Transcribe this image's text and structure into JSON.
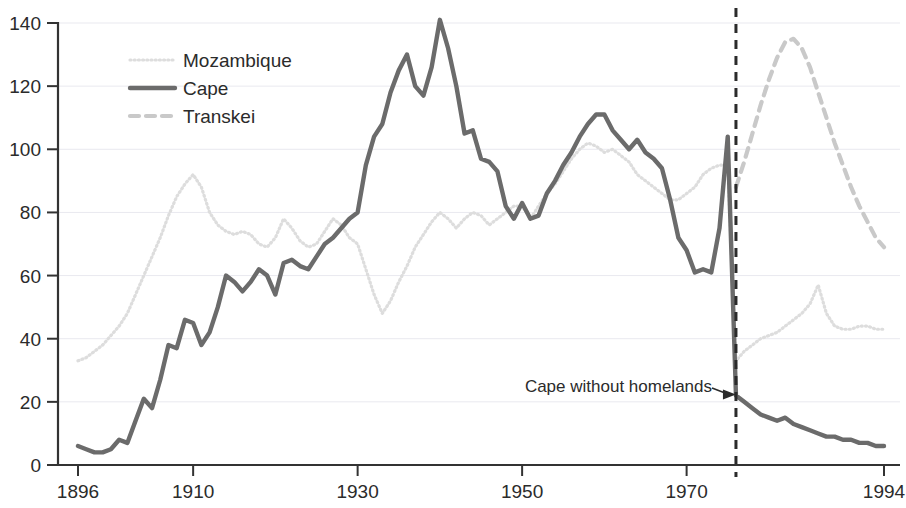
{
  "chart_data": {
    "type": "line",
    "title": "",
    "xlabel": "",
    "ylabel": "",
    "xlim": [
      1896,
      1994
    ],
    "ylim": [
      0,
      140
    ],
    "yticks": [
      0,
      20,
      40,
      60,
      80,
      100,
      120,
      140
    ],
    "xticks": [
      1896,
      1910,
      1930,
      1950,
      1970,
      1994
    ],
    "grid": true,
    "legend_position": "upper-left-inside",
    "annotations": [
      {
        "text": "Cape without homelands",
        "x": 1976,
        "y": 22,
        "arrow": true
      }
    ],
    "vertical_reference_line": {
      "x": 1976,
      "style": "dashed",
      "color": "#2b2b2b"
    },
    "series": [
      {
        "name": "Mozambique",
        "color": "#dddddd",
        "style": "dotted",
        "x": [
          1896,
          1897,
          1898,
          1899,
          1900,
          1901,
          1902,
          1903,
          1904,
          1905,
          1906,
          1907,
          1908,
          1909,
          1910,
          1911,
          1912,
          1913,
          1914,
          1915,
          1916,
          1917,
          1918,
          1919,
          1920,
          1921,
          1922,
          1923,
          1924,
          1925,
          1926,
          1927,
          1928,
          1929,
          1930,
          1931,
          1932,
          1933,
          1934,
          1935,
          1936,
          1937,
          1938,
          1939,
          1940,
          1941,
          1942,
          1943,
          1944,
          1945,
          1946,
          1947,
          1948,
          1949,
          1950,
          1951,
          1952,
          1953,
          1954,
          1955,
          1956,
          1957,
          1958,
          1959,
          1960,
          1961,
          1962,
          1963,
          1964,
          1965,
          1966,
          1967,
          1968,
          1969,
          1970,
          1971,
          1972,
          1973,
          1974,
          1975,
          1976,
          1977,
          1978,
          1979,
          1980,
          1981,
          1982,
          1983,
          1984,
          1985,
          1986,
          1987,
          1988,
          1989,
          1990,
          1991,
          1992,
          1993,
          1994
        ],
        "values": [
          33,
          34,
          36,
          38,
          41,
          44,
          48,
          54,
          60,
          66,
          72,
          79,
          85,
          89,
          92,
          88,
          80,
          76,
          74,
          73,
          74,
          73,
          70,
          69,
          72,
          78,
          75,
          71,
          69,
          70,
          74,
          78,
          76,
          72,
          70,
          62,
          54,
          48,
          52,
          58,
          63,
          69,
          73,
          77,
          80,
          78,
          75,
          78,
          80,
          79,
          76,
          78,
          80,
          82,
          82,
          78,
          82,
          86,
          89,
          93,
          97,
          100,
          102,
          101,
          99,
          100,
          98,
          96,
          92,
          90,
          88,
          86,
          84,
          84,
          86,
          88,
          92,
          94,
          95,
          95,
          33,
          36,
          38,
          40,
          41,
          42,
          44,
          46,
          48,
          51,
          57,
          48,
          44,
          43,
          43,
          44,
          44,
          43,
          43
        ]
      },
      {
        "name": "Cape",
        "color": "#6b6b6b",
        "style": "solid",
        "x": [
          1896,
          1897,
          1898,
          1899,
          1900,
          1901,
          1902,
          1903,
          1904,
          1905,
          1906,
          1907,
          1908,
          1909,
          1910,
          1911,
          1912,
          1913,
          1914,
          1915,
          1916,
          1917,
          1918,
          1919,
          1920,
          1921,
          1922,
          1923,
          1924,
          1925,
          1926,
          1927,
          1928,
          1929,
          1930,
          1931,
          1932,
          1933,
          1934,
          1935,
          1936,
          1937,
          1938,
          1939,
          1940,
          1941,
          1942,
          1943,
          1944,
          1945,
          1946,
          1947,
          1948,
          1949,
          1950,
          1951,
          1952,
          1953,
          1954,
          1955,
          1956,
          1957,
          1958,
          1959,
          1960,
          1961,
          1962,
          1963,
          1964,
          1965,
          1966,
          1967,
          1968,
          1969,
          1970,
          1971,
          1972,
          1973,
          1974,
          1975,
          1976,
          1977,
          1978,
          1979,
          1980,
          1981,
          1982,
          1983,
          1984,
          1985,
          1986,
          1987,
          1988,
          1989,
          1990,
          1991,
          1992,
          1993,
          1994
        ],
        "values": [
          6,
          5,
          4,
          4,
          5,
          8,
          7,
          14,
          21,
          18,
          27,
          38,
          37,
          46,
          45,
          38,
          42,
          50,
          60,
          58,
          55,
          58,
          62,
          60,
          54,
          64,
          65,
          63,
          62,
          66,
          70,
          72,
          75,
          78,
          80,
          95,
          104,
          108,
          118,
          125,
          130,
          120,
          117,
          126,
          141,
          132,
          120,
          105,
          106,
          97,
          96,
          93,
          82,
          78,
          83,
          78,
          79,
          86,
          90,
          95,
          99,
          104,
          108,
          111,
          111,
          106,
          103,
          100,
          103,
          99,
          97,
          94,
          84,
          72,
          68,
          61,
          62,
          61,
          75,
          104,
          22,
          20,
          18,
          16,
          15,
          14,
          15,
          13,
          12,
          11,
          10,
          9,
          9,
          8,
          8,
          7,
          7,
          6,
          6
        ]
      },
      {
        "name": "Transkei",
        "color": "#c9c9c9",
        "style": "dashed",
        "x": [
          1976,
          1977,
          1978,
          1979,
          1980,
          1981,
          1982,
          1983,
          1984,
          1985,
          1986,
          1987,
          1988,
          1989,
          1990,
          1991,
          1992,
          1993,
          1994
        ],
        "values": [
          88,
          96,
          105,
          114,
          122,
          129,
          134,
          135,
          132,
          126,
          118,
          110,
          102,
          95,
          88,
          82,
          77,
          72,
          69
        ]
      }
    ]
  },
  "legend": {
    "items": [
      {
        "label": "Mozambique"
      },
      {
        "label": "Cape"
      },
      {
        "label": "Transkei"
      }
    ]
  },
  "axes": {
    "y_tick_labels": [
      "140",
      "120",
      "100",
      "80",
      "60",
      "40",
      "20",
      "0"
    ],
    "x_tick_labels": [
      "1896",
      "1910",
      "1930",
      "1950",
      "1970",
      "1994"
    ]
  },
  "annotation": {
    "text": "Cape without homelands"
  }
}
